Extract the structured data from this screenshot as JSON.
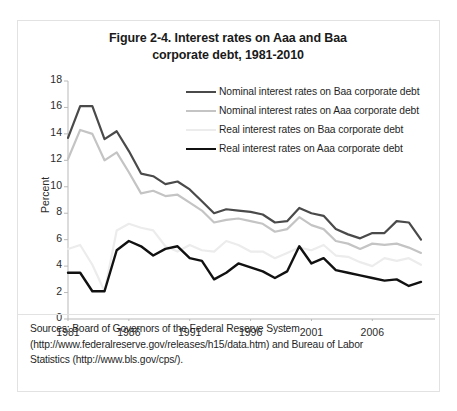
{
  "figure": {
    "title_line1": "Figure 2-4. Interest rates on Aaa and Baa",
    "title_line2": "corporate debt, 1981-2010",
    "source_line1": "Sources: Board of Governors of the Federal Reserve System",
    "source_line2": "(http://www.federalreserve.gov/releases/h15/data.htm) and  Bureau of Labor",
    "source_line3": "Statistics (http://www.bls.gov/cps/)."
  },
  "chart_data": {
    "type": "line",
    "title": "Figure 2-4. Interest rates on Aaa and Baa corporate debt, 1981-2010",
    "xlabel": "",
    "ylabel": "Percent",
    "ylim": [
      0,
      18
    ],
    "xlim": [
      1981,
      2010
    ],
    "yticks": [
      0,
      2,
      4,
      6,
      8,
      10,
      12,
      14,
      16,
      18
    ],
    "xticks": [
      1981,
      1986,
      1991,
      1996,
      2001,
      2006
    ],
    "grid": false,
    "legend_position": "upper right",
    "x": [
      1981,
      1982,
      1983,
      1984,
      1985,
      1986,
      1987,
      1988,
      1989,
      1990,
      1991,
      1992,
      1993,
      1994,
      1995,
      1996,
      1997,
      1998,
      1999,
      2000,
      2001,
      2002,
      2003,
      2004,
      2005,
      2006,
      2007,
      2008,
      2009,
      2010
    ],
    "series": [
      {
        "name": "Nominal interest rates on Baa corporate debt",
        "color": "#4a4a4a",
        "width": 2.2,
        "values": [
          13.7,
          16.1,
          16.1,
          13.6,
          14.2,
          12.7,
          11.0,
          10.8,
          10.2,
          10.4,
          9.8,
          8.9,
          8.0,
          8.3,
          8.2,
          8.1,
          7.9,
          7.3,
          7.4,
          8.4,
          8.0,
          7.8,
          6.8,
          6.4,
          6.1,
          6.5,
          6.5,
          7.4,
          7.3,
          6.0
        ]
      },
      {
        "name": "Nominal interest rates on Aaa corporate debt",
        "color": "#c4c4c4",
        "width": 2.2,
        "values": [
          12.1,
          14.3,
          14.0,
          12.0,
          12.6,
          11.1,
          9.5,
          9.7,
          9.3,
          9.4,
          8.8,
          8.2,
          7.3,
          7.5,
          7.6,
          7.4,
          7.2,
          6.6,
          6.8,
          7.7,
          7.1,
          6.8,
          5.9,
          5.7,
          5.3,
          5.7,
          5.6,
          5.7,
          5.4,
          5.0
        ]
      },
      {
        "name": "Real interest rates on Baa corporate debt",
        "color": "#ececec",
        "width": 2.2,
        "values": [
          5.3,
          5.6,
          4.1,
          2.1,
          6.7,
          7.2,
          6.9,
          6.7,
          5.5,
          5.1,
          5.6,
          5.2,
          5.1,
          5.9,
          5.6,
          5.1,
          5.1,
          4.6,
          5.0,
          5.4,
          5.2,
          5.6,
          4.8,
          4.7,
          4.3,
          4.0,
          4.6,
          4.4,
          4.6,
          4.1
        ]
      },
      {
        "name": "Real interest rates on Aaa corporate debt",
        "color": "#111111",
        "width": 2.4,
        "values": [
          3.5,
          3.5,
          2.1,
          2.1,
          5.2,
          5.9,
          5.5,
          4.8,
          5.3,
          5.5,
          4.6,
          4.4,
          3.0,
          3.5,
          4.2,
          3.9,
          3.6,
          3.1,
          3.6,
          5.5,
          4.2,
          4.6,
          3.7,
          3.5,
          3.3,
          3.1,
          2.9,
          3.0,
          2.5,
          2.8
        ]
      }
    ]
  }
}
